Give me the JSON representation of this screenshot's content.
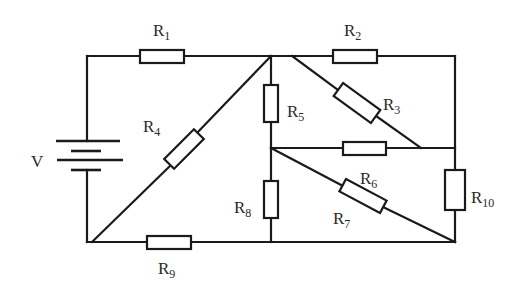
{
  "diagram": {
    "type": "circuit",
    "source": {
      "label": "V",
      "kind": "battery"
    },
    "resistors": [
      {
        "id": "R1",
        "base": "R",
        "sub": "1"
      },
      {
        "id": "R2",
        "base": "R",
        "sub": "2"
      },
      {
        "id": "R3",
        "base": "R",
        "sub": "3"
      },
      {
        "id": "R4",
        "base": "R",
        "sub": "4"
      },
      {
        "id": "R5",
        "base": "R",
        "sub": "5"
      },
      {
        "id": "R6",
        "base": "R",
        "sub": "6"
      },
      {
        "id": "R7",
        "base": "R",
        "sub": "7"
      },
      {
        "id": "R8",
        "base": "R",
        "sub": "8"
      },
      {
        "id": "R9",
        "base": "R",
        "sub": "9"
      },
      {
        "id": "R10",
        "base": "R",
        "sub": "10"
      }
    ],
    "colors": {
      "stroke": "#1a1a1a",
      "text": "#2a2a2a",
      "background": "#ffffff"
    }
  }
}
